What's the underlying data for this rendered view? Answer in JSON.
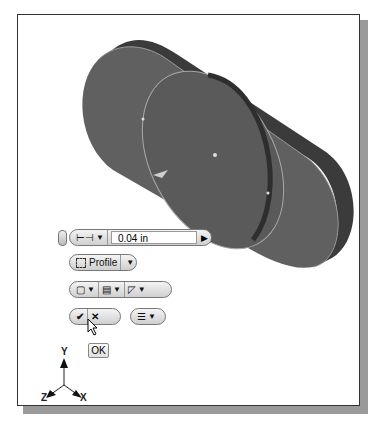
{
  "viewport": {
    "model": {
      "description": "slot-shaped extruded plate with circular profile",
      "color": "#5f5f5f",
      "edge_color": "#3e3e3e"
    }
  },
  "mini_toolbar": {
    "distance": {
      "value": "0.04 in",
      "icon": "dimension-icon"
    },
    "profile": {
      "label": "Profile",
      "icon": "profile-select-icon"
    },
    "row3": [
      {
        "icon": "cube-icon"
      },
      {
        "icon": "extrude-output-icon"
      },
      {
        "icon": "direction-icon"
      }
    ],
    "ok_icon": "checkmark-icon",
    "cancel_icon": "x-icon",
    "options_icon": "list-options-icon"
  },
  "tooltip": {
    "label": "OK"
  },
  "triad": {
    "x": "X",
    "y": "Y",
    "z": "Z"
  }
}
